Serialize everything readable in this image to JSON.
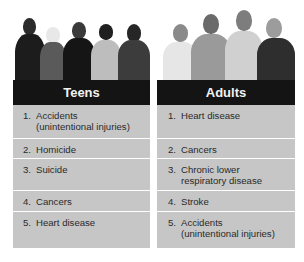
{
  "panels": [
    {
      "title": "Teens",
      "photo": "group-of-five-teens-photo",
      "items": [
        {
          "num": "1.",
          "text": "Accidents\n(unintentional injuries)"
        },
        {
          "num": "2.",
          "text": "Homicide"
        },
        {
          "num": "3.",
          "text": "Suicide"
        },
        {
          "num": "4.",
          "text": "Cancers"
        },
        {
          "num": "5.",
          "text": "Heart disease"
        }
      ]
    },
    {
      "title": "Adults",
      "photo": "group-of-four-adults-photo",
      "items": [
        {
          "num": "1.",
          "text": "Heart disease"
        },
        {
          "num": "2.",
          "text": "Cancers"
        },
        {
          "num": "3.",
          "text": "Chronic lower\nrespiratory disease"
        },
        {
          "num": "4.",
          "text": "Stroke"
        },
        {
          "num": "5.",
          "text": "Accidents\n(unintentional injuries)"
        }
      ]
    }
  ],
  "colors": {
    "header_bg": "#141414",
    "header_text": "#f2f2f2",
    "row_bg": "#c6c6c6",
    "divider": "#ffffff"
  }
}
